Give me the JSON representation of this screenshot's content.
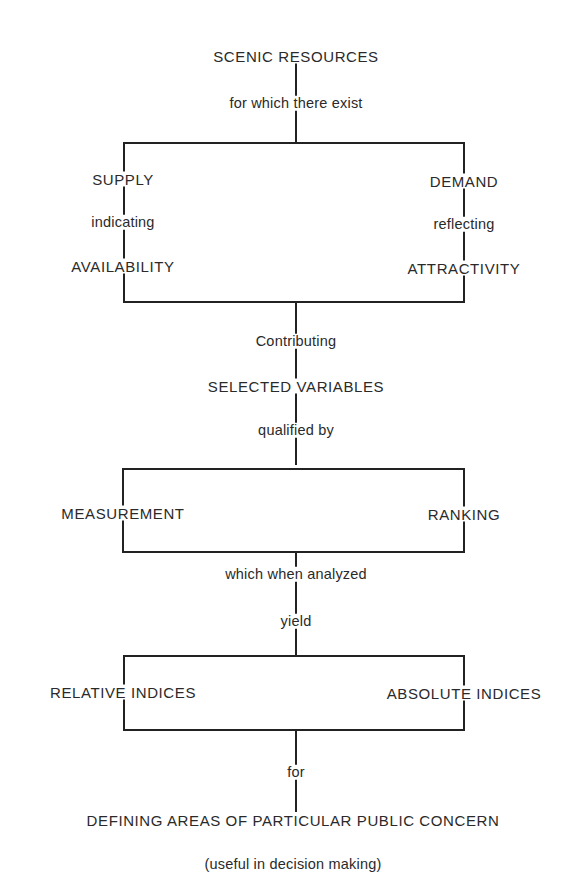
{
  "diagram": {
    "title": "SCENIC RESOURCES",
    "connectors": {
      "c1": "for which there exist",
      "c2": "Contributing",
      "c3": "qualified by",
      "c4": "which when analyzed",
      "c5": "yield",
      "c6": "for"
    },
    "box1": {
      "left": {
        "top": "SUPPLY",
        "link": "indicating",
        "bottom": "AVAILABILITY"
      },
      "right": {
        "top": "DEMAND",
        "link": "reflecting",
        "bottom": "ATTRACTIVITY"
      }
    },
    "middle_node": "SELECTED VARIABLES",
    "box2": {
      "left": "MEASUREMENT",
      "right": "RANKING"
    },
    "box3": {
      "left": "RELATIVE INDICES",
      "right": "ABSOLUTE INDICES"
    },
    "outcome": "DEFINING AREAS OF PARTICULAR PUBLIC CONCERN",
    "note": "(useful in decision making)"
  }
}
